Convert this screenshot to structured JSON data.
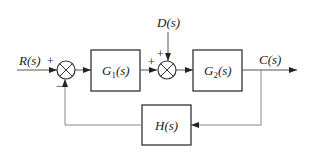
{
  "diagram": {
    "type": "feedback control block diagram",
    "input_label": "R(s)",
    "disturbance_label": "D(s)",
    "output_label": "C(s)",
    "blocks": [
      {
        "id": "G1",
        "label_main": "G",
        "label_sub": "1",
        "label_tail": "(s)"
      },
      {
        "id": "G2",
        "label_main": "G",
        "label_sub": "2",
        "label_tail": "(s)"
      },
      {
        "id": "H",
        "label": "H(s)"
      }
    ],
    "junctions": [
      {
        "id": "sum1",
        "signs": {
          "top_left": "+",
          "bottom": "−"
        }
      },
      {
        "id": "sum2",
        "signs": {
          "left": "+",
          "top": "+"
        }
      }
    ],
    "colors": {
      "line": "#333333",
      "line_light": "#888888",
      "text": "#222222"
    }
  }
}
